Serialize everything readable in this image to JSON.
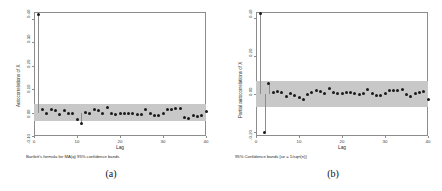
{
  "figure": {
    "panels": [
      {
        "id": "a",
        "caption": "(a)",
        "note": "Bartlett's formula for MA(q) 95% confidence bands",
        "chart_index": 0
      },
      {
        "id": "b",
        "caption": "(b)",
        "note": "95% Confidence bands [se = 1/sqrt(n)]",
        "chart_index": 1
      }
    ],
    "band_color": "#c8c8c8",
    "point_color": "#1a1a1a",
    "frame_color": "#8c8c8c"
  },
  "chart_data": [
    {
      "type": "scatter",
      "title": "",
      "subtitle": "Bartlett's formula for MA(q) 95% confidence bands",
      "xlabel": "Lag",
      "ylabel": "Autocorrelations of X",
      "xlim": [
        0,
        40
      ],
      "ylim": [
        -0.1,
        0.43
      ],
      "xticks": [
        0,
        10,
        20,
        30,
        40
      ],
      "xticklabels": [
        "0",
        "10",
        "20",
        "30",
        "40"
      ],
      "yticks": [
        -0.1,
        0.0,
        0.1,
        0.2,
        0.3,
        0.4
      ],
      "yticklabels": [
        "-0.10",
        "0.00",
        "0.10",
        "0.20",
        "0.30",
        "0.40"
      ],
      "grid": false,
      "legend": "none",
      "confidence_band": {
        "upper": 0.037,
        "lower": -0.037,
        "label": "95% confidence band"
      },
      "x": [
        1,
        2,
        3,
        4,
        5,
        6,
        7,
        8,
        9,
        10,
        11,
        12,
        13,
        14,
        15,
        16,
        17,
        18,
        19,
        20,
        21,
        22,
        23,
        24,
        25,
        26,
        27,
        28,
        29,
        30,
        31,
        32,
        33,
        34,
        35,
        36,
        37,
        38,
        39,
        40
      ],
      "values": [
        0.42,
        0.015,
        -0.005,
        0.012,
        0.01,
        -0.006,
        0.007,
        -0.004,
        -0.004,
        -0.03,
        -0.048,
        0.001,
        -0.002,
        0.012,
        0.008,
        -0.003,
        0.022,
        -0.004,
        -0.006,
        -0.004,
        -0.004,
        -0.004,
        -0.004,
        -0.006,
        -0.006,
        0.012,
        -0.004,
        -0.014,
        -0.012,
        -0.002,
        0.012,
        0.014,
        0.016,
        0.018,
        -0.02,
        -0.026,
        -0.012,
        -0.016,
        -0.014,
        0.004
      ]
    },
    {
      "type": "scatter",
      "title": "",
      "subtitle": "95% Confidence bands [se = 1/sqrt(n)]",
      "xlabel": "Lag",
      "ylabel": "Partial autocorrelations of X",
      "xlim": [
        0,
        40
      ],
      "ylim": [
        -0.22,
        0.43
      ],
      "xticks": [
        0,
        10,
        20,
        30,
        40
      ],
      "xticklabels": [
        "0",
        "10",
        "20",
        "30",
        "40"
      ],
      "yticks": [
        -0.2,
        0.0,
        0.2,
        0.4
      ],
      "yticklabels": [
        "-0.20",
        "0.00",
        "0.20",
        "0.40"
      ],
      "grid": false,
      "legend": "none",
      "confidence_band": {
        "upper": 0.07,
        "lower": -0.07,
        "label": "95% confidence band"
      },
      "x": [
        1,
        2,
        3,
        4,
        5,
        6,
        7,
        8,
        9,
        10,
        11,
        12,
        13,
        14,
        15,
        16,
        17,
        18,
        19,
        20,
        21,
        22,
        23,
        24,
        25,
        26,
        27,
        28,
        29,
        30,
        31,
        32,
        33,
        34,
        35,
        36,
        37,
        38,
        39,
        40
      ],
      "values": [
        0.42,
        -0.2,
        0.055,
        0.01,
        0.012,
        0.008,
        -0.012,
        0.002,
        -0.01,
        -0.02,
        -0.03,
        0.0,
        0.01,
        0.018,
        0.012,
        0.004,
        0.03,
        0.006,
        0.002,
        0.004,
        0.01,
        0.006,
        0.002,
        0.0,
        0.004,
        0.022,
        0.004,
        -0.01,
        -0.006,
        0.004,
        0.016,
        0.018,
        0.02,
        0.022,
        -0.004,
        -0.012,
        0.004,
        0.01,
        0.014,
        -0.03
      ]
    }
  ]
}
